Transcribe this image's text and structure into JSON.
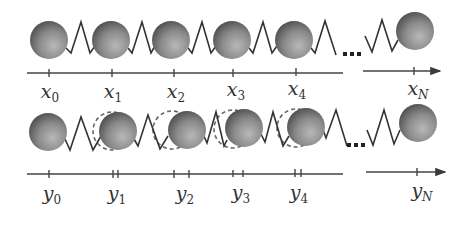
{
  "colors": {
    "ball_light": "#b4b4b4",
    "ball_dark": "#505050",
    "line": "#3a3a3a",
    "dashed": "#666666",
    "background": "#ffffff"
  },
  "row_top": {
    "description": "equilibrium positions",
    "balls_cx": [
      49,
      111,
      171,
      232,
      294
    ],
    "ball_cy": 40,
    "ball_last_cx": 415,
    "ball_last_cy": 31,
    "radius": 19,
    "axis_y": 73,
    "ticks": [
      49,
      112,
      174,
      233,
      296
    ],
    "tick_last": 414,
    "labels": [
      {
        "base": "x",
        "sub": "0"
      },
      {
        "base": "x",
        "sub": "1"
      },
      {
        "base": "x",
        "sub": "2"
      },
      {
        "base": "x",
        "sub": "3"
      },
      {
        "base": "x",
        "sub": "4"
      },
      {
        "base": "x",
        "sub": "N"
      }
    ]
  },
  "row_bottom": {
    "description": "displaced positions with dashed equilibrium outlines",
    "balls_cx": [
      48,
      117,
      186,
      244,
      306
    ],
    "dashed_cx": [
      null,
      112,
      172,
      233,
      296
    ],
    "ball_cy": 131,
    "ball_last_cx": 418,
    "ball_last_cy": 123,
    "radius": 19,
    "axis_y": 174,
    "ticks": [
      [
        49
      ],
      [
        113,
        118
      ],
      [
        174,
        189
      ],
      [
        233,
        243
      ],
      [
        295,
        301
      ]
    ],
    "tick_last": 417,
    "labels": [
      {
        "base": "y",
        "sub": "0"
      },
      {
        "base": "y",
        "sub": "1"
      },
      {
        "base": "y",
        "sub": "2"
      },
      {
        "base": "y",
        "sub": "3"
      },
      {
        "base": "y",
        "sub": "4"
      },
      {
        "base": "y",
        "sub": "N"
      }
    ]
  },
  "ellipsis": "..."
}
